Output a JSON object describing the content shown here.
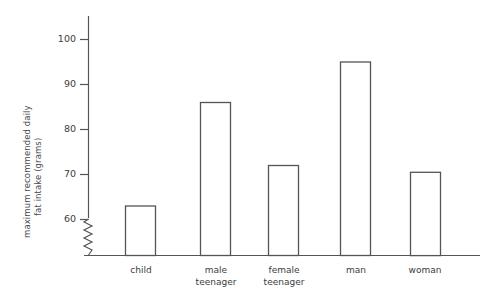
{
  "chart_data": {
    "type": "bar",
    "title": "",
    "xlabel": "",
    "ylabel": "maximum recommended daily fat intake (grams)",
    "ylabel_line1": "maximum recommended daily",
    "ylabel_line2": "fat intake (grams)",
    "categories": [
      "child",
      "male\nteenager",
      "female\nteenager",
      "man",
      "woman"
    ],
    "category_labels": [
      "child",
      "male teenager",
      "female teenager",
      "man",
      "woman"
    ],
    "values": [
      63,
      86,
      72,
      95,
      70.5
    ],
    "ylim": [
      55,
      104
    ],
    "yticks": [
      60,
      70,
      80,
      90,
      100
    ],
    "ytick_labels": [
      "60",
      "70",
      "80",
      "90",
      "100"
    ],
    "axis_break": true,
    "axis_break_note": "zigzag break on y-axis below 60",
    "grid": false,
    "legend": false,
    "bar_fill_color": "#ffffff",
    "bar_edge_color": "#555555",
    "axis_color": "#555555",
    "background_color": "#ffffff"
  }
}
